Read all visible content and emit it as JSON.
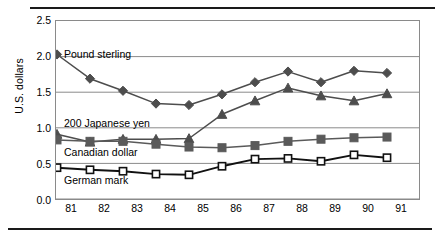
{
  "chart_data": {
    "type": "line",
    "title": "",
    "xlabel": "",
    "ylabel": "U.S. dollars",
    "x": [
      "81",
      "82",
      "83",
      "84",
      "85",
      "86",
      "87",
      "88",
      "89",
      "90",
      "91"
    ],
    "categories": [
      "81",
      "82",
      "83",
      "84",
      "85",
      "86",
      "87",
      "88",
      "89",
      "90",
      "91"
    ],
    "ylim": [
      0.0,
      2.5
    ],
    "yticks": [
      "0.0",
      "0.5",
      "1.0",
      "1.5",
      "2.0",
      "2.5"
    ],
    "ytick_values": [
      0.0,
      0.5,
      1.0,
      1.5,
      2.0,
      2.5
    ],
    "grid": true,
    "grid_axis": "y",
    "legend": "inline-annotations",
    "series": [
      {
        "name": "Pound sterling",
        "marker": "filled-diamond",
        "color": "#4d4d4d",
        "values": [
          2.03,
          1.69,
          1.52,
          1.34,
          1.32,
          1.47,
          1.64,
          1.79,
          1.64,
          1.8,
          1.77
        ]
      },
      {
        "name": "200 Japanese yen",
        "marker": "filled-triangle",
        "color": "#4d4d4d",
        "values": [
          0.91,
          0.8,
          0.84,
          0.84,
          0.85,
          1.19,
          1.38,
          1.56,
          1.45,
          1.38,
          1.48
        ]
      },
      {
        "name": "Canadian dollar",
        "marker": "filled-square",
        "color": "#5a5a5a",
        "values": [
          0.83,
          0.81,
          0.81,
          0.77,
          0.73,
          0.72,
          0.75,
          0.81,
          0.84,
          0.86,
          0.87
        ]
      },
      {
        "name": "German mark",
        "marker": "open-square",
        "color": "#111111",
        "values": [
          0.44,
          0.41,
          0.39,
          0.35,
          0.34,
          0.46,
          0.56,
          0.57,
          0.53,
          0.62,
          0.58
        ]
      }
    ],
    "annotations": [
      {
        "text": "Pound sterling",
        "x": 81,
        "y": 2.03
      },
      {
        "text": "200 Japanese yen",
        "x": 81,
        "y": 1.06
      },
      {
        "text": "Canadian dollar",
        "x": 81,
        "y": 0.65
      },
      {
        "text": "German mark",
        "x": 81,
        "y": 0.26
      }
    ]
  }
}
